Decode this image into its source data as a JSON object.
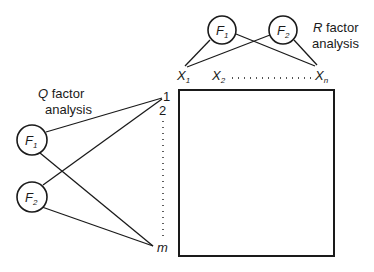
{
  "diagram": {
    "matrix": {
      "type": "data-matrix",
      "rows_label": "m",
      "cols_label": "n"
    },
    "q_analysis": {
      "title_letter": "Q",
      "title_rest": " factor",
      "title_line2": "analysis",
      "factors": [
        {
          "base": "F",
          "sub": "1"
        },
        {
          "base": "F",
          "sub": "2"
        }
      ],
      "row_labels": {
        "first": "1",
        "second": "2",
        "last": "m"
      }
    },
    "r_analysis": {
      "title_letter": "R",
      "title_rest": " factor",
      "title_line2": "analysis",
      "factors": [
        {
          "base": "F",
          "sub": "1"
        },
        {
          "base": "F",
          "sub": "2"
        }
      ],
      "col_labels": [
        {
          "base": "X",
          "sub": "1"
        },
        {
          "base": "X",
          "sub": "2"
        },
        {
          "base": "X",
          "sub": "n"
        }
      ]
    },
    "colors": {
      "line": "#1a1a1a",
      "background": "#ffffff"
    }
  }
}
